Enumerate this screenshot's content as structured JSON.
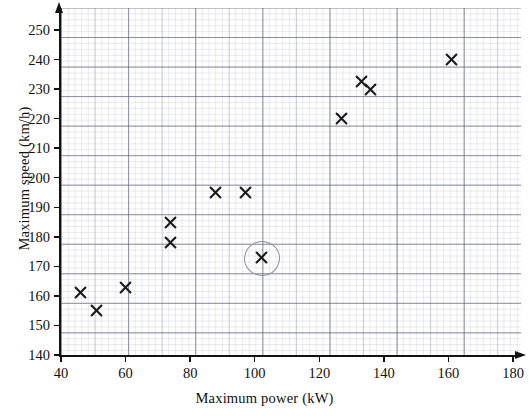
{
  "chart_data": {
    "type": "scatter",
    "title": "",
    "xlabel": "Maximum power (kW)",
    "ylabel": "Maximum speed (km/h)",
    "xlim": [
      40,
      186
    ],
    "ylim": [
      140,
      254
    ],
    "xticks": [
      40,
      60,
      80,
      100,
      120,
      140,
      160,
      180
    ],
    "xtick_labels": [
      "40",
      "60",
      "80",
      "100",
      "120",
      "140",
      "160",
      "180"
    ],
    "yticks": [
      140,
      150,
      160,
      170,
      180,
      190,
      200,
      210,
      220,
      230,
      240,
      250
    ],
    "ytick_labels": [
      "140",
      "150",
      "160",
      "170",
      "180",
      "190",
      "200",
      "210",
      "220",
      "230",
      "240",
      "250"
    ],
    "grid": true,
    "grid_style": "graph-paper",
    "marker": "x",
    "marker_color": "#1a1a1a",
    "legend": "none",
    "points": [
      {
        "x": 46,
        "y": 161,
        "label": "46 kW, 161 km/h",
        "highlighted": false
      },
      {
        "x": 51,
        "y": 155,
        "label": "51 kW, 155 km/h",
        "highlighted": false
      },
      {
        "x": 60,
        "y": 163,
        "label": "60 kW, 163 km/h",
        "highlighted": false
      },
      {
        "x": 74,
        "y": 185,
        "label": "74 kW, 185 km/h",
        "highlighted": false
      },
      {
        "x": 74,
        "y": 178,
        "label": "74 kW, 178 km/h",
        "highlighted": false
      },
      {
        "x": 88,
        "y": 195,
        "label": "88 kW, 195 km/h",
        "highlighted": false
      },
      {
        "x": 97,
        "y": 195,
        "label": "97 kW, 195 km/h",
        "highlighted": false
      },
      {
        "x": 102,
        "y": 173,
        "label": "102 kW, 173 km/h",
        "highlighted": true
      },
      {
        "x": 127,
        "y": 220,
        "label": "127 kW, 220 km/h",
        "highlighted": false
      },
      {
        "x": 133,
        "y": 232.5,
        "label": "133 kW, 232.5 km/h",
        "highlighted": false
      },
      {
        "x": 136,
        "y": 230,
        "label": "136 kW, 230 km/h",
        "highlighted": false
      },
      {
        "x": 161,
        "y": 240,
        "label": "161 kW, 240 km/h",
        "highlighted": false
      }
    ],
    "annotations": [
      {
        "type": "circle",
        "x": 102,
        "y": 173,
        "note": "hand-drawn circle around outlier point",
        "color": "#8e8e9c"
      }
    ]
  }
}
